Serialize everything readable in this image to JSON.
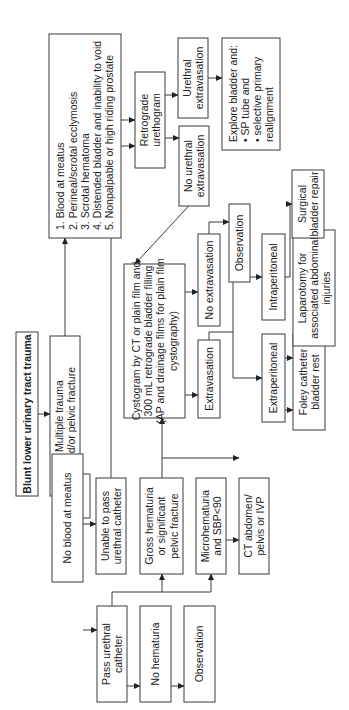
{
  "title": "Blunt lower urinary tract trauma",
  "nodes": {
    "title": {
      "lines": [
        "Blunt lower urinary tract trauma"
      ]
    },
    "multiple_trauma": {
      "lines": [
        "Multiple trauma",
        "and/or pelvic fracture"
      ]
    },
    "signs": {
      "lines": [
        "1.  Blood at meatus",
        "2.  Perineal/scrotal ecclymosis",
        "3.  Scrotal hematoma",
        "4.  Distended bladder and inability to void",
        "5.  Nonpalpable or high riding prostate"
      ]
    },
    "retrograde": {
      "lines": [
        "Retrograde",
        "urethogram"
      ]
    },
    "urethral_extrav": {
      "lines": [
        "Urethral",
        "extravasation"
      ]
    },
    "no_urethral_extrav": {
      "lines": [
        "No urethral",
        "extravasation"
      ]
    },
    "explore": {
      "lines": [
        "Explore bladder and:",
        "•  SP tube and",
        "•  selective primary",
        "    realignment"
      ]
    },
    "no_blood": {
      "lines": [
        "No blood at meatus"
      ]
    },
    "unable_pass": {
      "lines": [
        "Unable to pass",
        "urethral catheter"
      ]
    },
    "pass_cath": {
      "lines": [
        "Pass urethral",
        "catheter"
      ]
    },
    "gross_hem": {
      "lines": [
        "Gross hematuria",
        "or significant",
        "pelvic fracture"
      ]
    },
    "no_hem": {
      "lines": [
        "No hematuria"
      ]
    },
    "micro_hem": {
      "lines": [
        "Microhematuria",
        "and SBP<90"
      ]
    },
    "obs_bottom": {
      "lines": [
        "Observation"
      ]
    },
    "ct_abd": {
      "lines": [
        "CT abdomen/",
        "pelvis or IVP"
      ]
    },
    "cystogram": {
      "lines": [
        "Cystogram by CT or plain film and",
        "300 mL retrograde bladder filling",
        "(AP and drainage films for plain film",
        "cystography)"
      ]
    },
    "extrav": {
      "lines": [
        "Extravasation"
      ]
    },
    "no_extrav": {
      "lines": [
        "No extravasation"
      ]
    },
    "obs_top": {
      "lines": [
        "Observation"
      ]
    },
    "extraperitoneal": {
      "lines": [
        "Extraperitoneal"
      ]
    },
    "intraperitoneal": {
      "lines": [
        "Intraperitoneal"
      ]
    },
    "foley": {
      "lines": [
        "Foley catheter",
        "bladder rest"
      ]
    },
    "laparotomy": {
      "lines": [
        "Laparotomy for",
        "associated abdominal",
        "injuries"
      ]
    },
    "surgical": {
      "lines": [
        "Surgical",
        "bladder repair"
      ]
    }
  }
}
